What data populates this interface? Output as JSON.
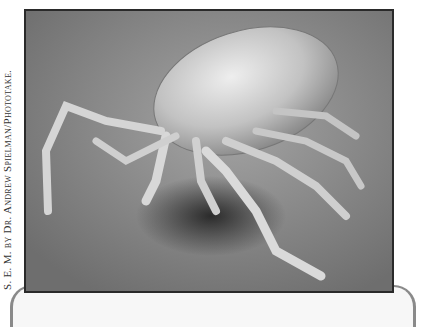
{
  "image": {
    "subject": "Scanning electron micrograph of a tick",
    "alt": "Grayscale SEM image of a tick with eight legs and a rounded body on a textured surface"
  },
  "credit": {
    "text": "S. E. M. by Dr. Andrew Spielman/Phototake."
  }
}
